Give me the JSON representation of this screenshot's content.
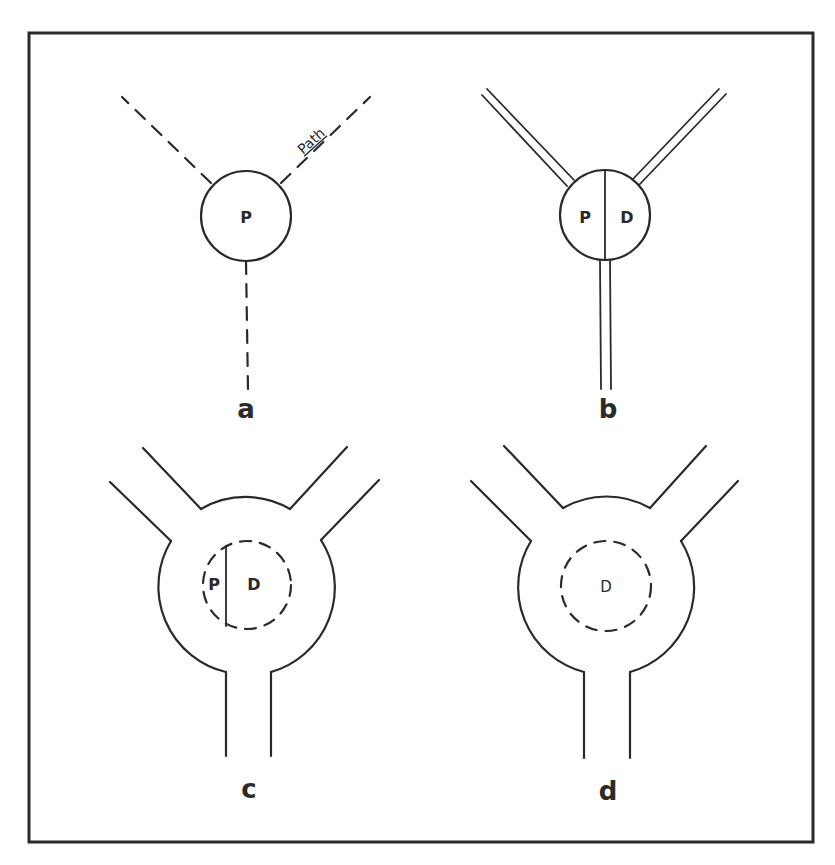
{
  "figure": {
    "panels": [
      {
        "id": "a",
        "label": "a",
        "nodes": [
          {
            "text": "P"
          }
        ],
        "path_label": "Path",
        "description": "Single circle P with three dashed paths"
      },
      {
        "id": "b",
        "label": "b",
        "nodes": [
          {
            "text": "P"
          },
          {
            "text": "D"
          }
        ],
        "description": "Circle split into P and D halves with three double-line paths"
      },
      {
        "id": "c",
        "label": "c",
        "nodes": [
          {
            "text": "P"
          },
          {
            "text": "D"
          }
        ],
        "description": "Large chamber with dashed inner circle split into small P and larger D regions, three wide channels"
      },
      {
        "id": "d",
        "label": "d",
        "nodes": [
          {
            "text": "D"
          }
        ],
        "description": "Large chamber with dashed inner circle D only, three wide channels"
      }
    ],
    "colors": {
      "ink": "#2a2a2a",
      "background": "#ffffff"
    }
  }
}
